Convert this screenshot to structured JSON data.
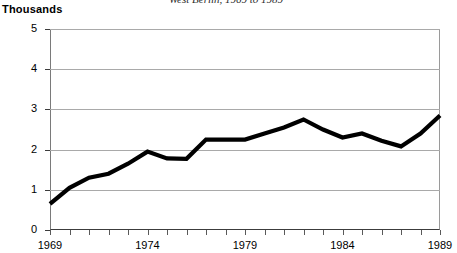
{
  "title": "West Berlin, 1969 to 1989",
  "axis_unit_label": "Thousands",
  "colors": {
    "series_line": "#000000",
    "gridline": "#a9a9a9",
    "axis": "#3c3c3c",
    "background": "#ffffff",
    "title_text": "#2b2b2b"
  },
  "chart_data": {
    "type": "line",
    "title": "West Berlin, 1969 to 1989",
    "xlabel": "",
    "ylabel": "Thousands",
    "ylim": [
      0,
      5
    ],
    "xlim": [
      1969,
      1989
    ],
    "grid": true,
    "legend": false,
    "yticks": [
      0,
      1,
      2,
      3,
      4,
      5
    ],
    "ytick_labels": [
      "0",
      "1",
      "2",
      "3",
      "4",
      "5"
    ],
    "xticks": [
      1969,
      1970,
      1971,
      1972,
      1973,
      1974,
      1975,
      1976,
      1977,
      1978,
      1979,
      1980,
      1981,
      1982,
      1983,
      1984,
      1985,
      1986,
      1987,
      1988,
      1989
    ],
    "xtick_labels_shown": [
      "1969",
      "1974",
      "1979",
      "1984",
      "1989"
    ],
    "xtick_labels_shown_values": [
      1969,
      1974,
      1979,
      1984,
      1989
    ],
    "x": [
      1969,
      1970,
      1971,
      1972,
      1973,
      1974,
      1975,
      1976,
      1977,
      1978,
      1979,
      1980,
      1981,
      1982,
      1983,
      1984,
      1985,
      1986,
      1987,
      1988,
      1989
    ],
    "series": [
      {
        "name": "West Berlin",
        "values": [
          0.65,
          1.05,
          1.3,
          1.4,
          1.65,
          1.95,
          1.78,
          1.77,
          2.25,
          2.25,
          2.25,
          2.4,
          2.55,
          2.75,
          2.5,
          2.3,
          2.4,
          2.22,
          2.08,
          2.4,
          2.85
        ]
      }
    ]
  }
}
